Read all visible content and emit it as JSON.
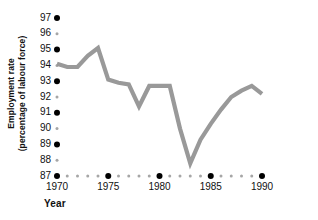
{
  "chart_data": {
    "type": "line",
    "title": "",
    "xlabel": "Year",
    "ylabel": "Employment rate (percentage of labour force)",
    "ylabel_line1": "Employment rate",
    "ylabel_line2": "(percentage of labour force)",
    "xlim": [
      1970,
      1990
    ],
    "ylim": [
      87,
      97
    ],
    "grid": false,
    "legend": "none",
    "line_color": "#999999",
    "major_tick_color": "#000000",
    "minor_tick_color": "#a6a6a6",
    "y_ticks": [
      87,
      88,
      89,
      90,
      91,
      92,
      93,
      94,
      95,
      96,
      97
    ],
    "y_tick_labels": [
      "87",
      "88",
      "89",
      "90",
      "91",
      "92",
      "93",
      "94",
      "95",
      "96",
      "97"
    ],
    "y_major_ticks": [
      87,
      89,
      91,
      93,
      95,
      97
    ],
    "y_minor_ticks": [
      88,
      90,
      92,
      94,
      96
    ],
    "x_ticks": [
      1970,
      1971,
      1972,
      1973,
      1974,
      1975,
      1976,
      1977,
      1978,
      1979,
      1980,
      1981,
      1982,
      1983,
      1984,
      1985,
      1986,
      1987,
      1988,
      1989,
      1990
    ],
    "x_tick_labels": [
      "1970",
      "1975",
      "1980",
      "1985",
      "1990"
    ],
    "x_major_ticks": [
      1970,
      1975,
      1980,
      1985,
      1990
    ],
    "x_minor_ticks": [
      1971,
      1972,
      1973,
      1974,
      1976,
      1977,
      1978,
      1979,
      1981,
      1982,
      1983,
      1984,
      1986,
      1987,
      1988,
      1989
    ],
    "x": [
      1970,
      1971,
      1972,
      1973,
      1974,
      1975,
      1976,
      1977,
      1978,
      1979,
      1980,
      1981,
      1982,
      1983,
      1984,
      1985,
      1986,
      1987,
      1988,
      1989,
      1990
    ],
    "values": [
      94.1,
      93.9,
      93.9,
      94.6,
      95.1,
      93.1,
      92.9,
      92.8,
      91.4,
      92.7,
      92.7,
      92.7,
      90.0,
      87.8,
      89.3,
      90.3,
      91.2,
      92.0,
      92.4,
      92.7,
      92.2
    ]
  }
}
